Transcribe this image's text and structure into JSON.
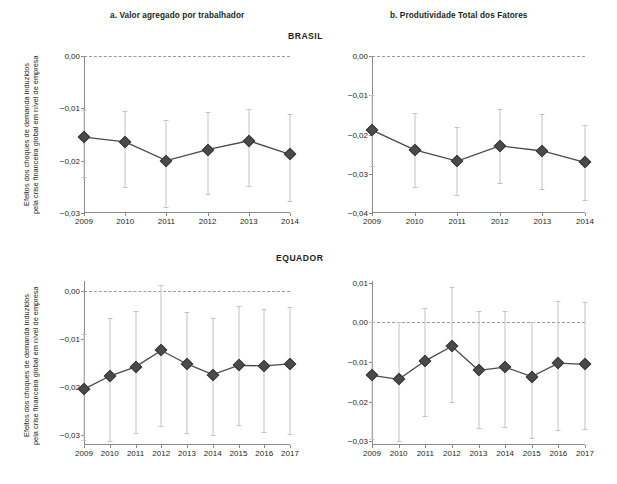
{
  "figure": {
    "panel_a_title": "a. Valor agregado por trabalhador",
    "panel_b_title": "b. Produtividade Total dos Fatores",
    "country_top": "BRASIL",
    "country_bottom": "EQUADOR",
    "ylabel_line1": "Efeitos dos choques de demanda induzidos",
    "ylabel_line2": "pela crise financeira global em nível de empresa",
    "marker_color": "#4a4a4a",
    "line_color": "#4a4a4a",
    "errorbar_color": "#c4c4c4",
    "zeroline_color": "#9a9a9a",
    "axis_color": "#8a8a8a"
  },
  "chart_data": [
    {
      "id": "brasil-a",
      "type": "line",
      "title": "a. Valor agregado por trabalhador",
      "group": "BRASIL",
      "xlabel": "",
      "ylabel": "Efeitos dos choques de demanda induzidos pela crise financeira global em nível de empresa",
      "x": [
        "2009",
        "2010",
        "2011",
        "2012",
        "2013",
        "2014"
      ],
      "xticklabels": [
        "2009",
        "2010",
        "2011",
        "2012",
        "2013",
        "2014"
      ],
      "yticklabels": [
        "0,00",
        "−0,01",
        "−0,02",
        "−0,03"
      ],
      "ytickvalues": [
        0.0,
        -0.01,
        -0.02,
        -0.03
      ],
      "ylim": [
        -0.03,
        0.0
      ],
      "grid": false,
      "legend": "none",
      "zeroline": 0.0,
      "values": [
        -0.0155,
        -0.0164,
        -0.02,
        -0.0179,
        -0.0162,
        -0.0188
      ],
      "error_low": [
        -0.0231,
        -0.025,
        -0.0288,
        -0.0264,
        -0.0249,
        -0.0277
      ],
      "error_high": [
        -0.0104,
        -0.0105,
        -0.0123,
        -0.0107,
        -0.0101,
        -0.011
      ]
    },
    {
      "id": "brasil-b",
      "type": "line",
      "title": "b. Produtividade Total dos Fatores",
      "group": "BRASIL",
      "xlabel": "",
      "ylabel": "",
      "x": [
        "2009",
        "2010",
        "2011",
        "2012",
        "2013",
        "2014"
      ],
      "xticklabels": [
        "2009",
        "2010",
        "2011",
        "2012",
        "2013",
        "2014"
      ],
      "yticklabels": [
        "0,00",
        "−0,01",
        "−0,02",
        "−0,03",
        "−0,04"
      ],
      "ytickvalues": [
        0.0,
        -0.01,
        -0.02,
        -0.03,
        -0.04
      ],
      "ylim": [
        -0.04,
        0.0
      ],
      "grid": false,
      "legend": "none",
      "zeroline": 0.0,
      "values": [
        -0.0189,
        -0.0239,
        -0.0268,
        -0.0229,
        -0.0242,
        -0.0271
      ],
      "error_low": [
        -0.0279,
        -0.0333,
        -0.0355,
        -0.0323,
        -0.0339,
        -0.0366
      ],
      "error_high": [
        -0.01,
        -0.0145,
        -0.0182,
        -0.0136,
        -0.0147,
        -0.0177
      ]
    },
    {
      "id": "equador-a",
      "type": "line",
      "title": "a. Valor agregado por trabalhador",
      "group": "EQUADOR",
      "xlabel": "",
      "ylabel": "Efeitos dos choques de demanda induzidos pela crise financeira global em nível de empresa",
      "x": [
        "2009",
        "2010",
        "2011",
        "2012",
        "2013",
        "2014",
        "2015",
        "2016",
        "2017"
      ],
      "xticklabels": [
        "2009",
        "2010",
        "2011",
        "2012",
        "2013",
        "2014",
        "2015",
        "2016",
        "2017"
      ],
      "yticklabels": [
        "0,00",
        "−0,01",
        "−0,02",
        "−0,03"
      ],
      "ytickvalues": [
        0.0,
        -0.01,
        -0.02,
        -0.03
      ],
      "ylim": [
        -0.032,
        0.002
      ],
      "grid": false,
      "legend": "none",
      "zeroline": 0.0,
      "values": [
        -0.0204,
        -0.0177,
        -0.0158,
        -0.0124,
        -0.0152,
        -0.0174,
        -0.0155,
        -0.0156,
        -0.0152
      ],
      "error_low": [
        -0.031,
        -0.0312,
        -0.0295,
        -0.0281,
        -0.0296,
        -0.03,
        -0.0278,
        -0.0294,
        -0.0298
      ],
      "error_high": [
        -0.009,
        -0.0057,
        -0.0042,
        0.0011,
        -0.0045,
        -0.0057,
        -0.0031,
        -0.0039,
        -0.0033
      ]
    },
    {
      "id": "equador-b",
      "type": "line",
      "title": "b. Produtividade Total dos Fatores",
      "group": "EQUADOR",
      "xlabel": "",
      "ylabel": "",
      "x": [
        "2009",
        "2010",
        "2011",
        "2012",
        "2013",
        "2014",
        "2015",
        "2016",
        "2017"
      ],
      "xticklabels": [
        "2009",
        "2010",
        "2011",
        "2012",
        "2013",
        "2014",
        "2015",
        "2016",
        "2017"
      ],
      "yticklabels": [
        "0,01",
        "0,00",
        "−0,01",
        "−0,02",
        "−0,03"
      ],
      "ytickvalues": [
        0.01,
        0.0,
        -0.01,
        -0.02,
        -0.03
      ],
      "ylim": [
        -0.031,
        0.0105
      ],
      "grid": false,
      "legend": "none",
      "zeroline": 0.0,
      "values": [
        -0.0134,
        -0.0144,
        -0.0097,
        -0.006,
        -0.0121,
        -0.0113,
        -0.0137,
        -0.0103,
        -0.0106
      ],
      "error_low": [
        -0.0295,
        -0.03,
        -0.0236,
        -0.02,
        -0.0267,
        -0.0264,
        -0.0292,
        -0.0272,
        -0.027
      ],
      "error_high": [
        0.0002,
        0.0001,
        0.0037,
        0.009,
        0.003,
        0.003,
        0.0002,
        0.0055,
        0.0052
      ]
    }
  ]
}
